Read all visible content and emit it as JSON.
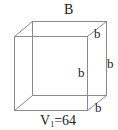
{
  "diagram": {
    "type": "cube-wireframe",
    "labels": {
      "top_edge": "B",
      "depth_top": "b",
      "front_height": "b",
      "back_height": "b",
      "depth_bottom": "b",
      "volume_symbol": "V",
      "volume_subscript": "1",
      "volume_value": "=64"
    },
    "colors": {
      "edge": "#8a8a8a",
      "text": "#222222",
      "background": "#ffffff"
    }
  }
}
